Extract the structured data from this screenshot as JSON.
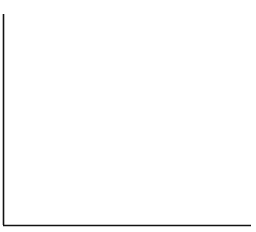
{
  "y_axis_label": "f",
  "colors": {
    "stroke": "#111111",
    "background": "#ffffff"
  },
  "chart_data": {
    "type": "line",
    "xlabel": "",
    "ylabel": "f",
    "grid": false,
    "legend": "none",
    "series": [
      {
        "name": "3",
        "center_px": 57,
        "peak_label": "3"
      },
      {
        "name": "2",
        "center_px": 96,
        "peak_label": "2"
      },
      {
        "name": "1",
        "center_px": 177,
        "peak_label": "1"
      }
    ],
    "annotations": [
      "Downward arrows from each curve peak to the baseline",
      "Peaks labeled 3, 2, 1 from left to right"
    ]
  },
  "peaks": [
    {
      "label": "3",
      "x": 57
    },
    {
      "label": "2",
      "x": 96
    },
    {
      "label": "1",
      "x": 177
    }
  ]
}
